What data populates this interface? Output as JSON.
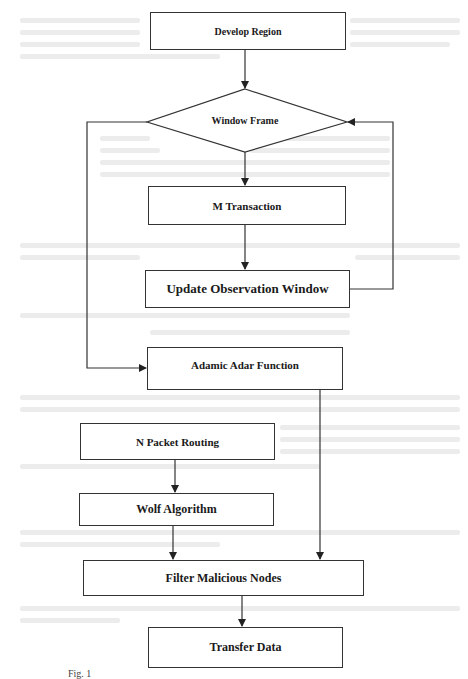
{
  "diagram": {
    "type": "flowchart",
    "nodes": [
      {
        "id": "develop_region",
        "label": "Develop Region",
        "shape": "rectangle"
      },
      {
        "id": "window_frame",
        "label": "Window Frame",
        "shape": "diamond"
      },
      {
        "id": "m_transaction",
        "label": "M Transaction",
        "shape": "rectangle"
      },
      {
        "id": "update_observation_window",
        "label": "Update Observation Window",
        "shape": "rectangle"
      },
      {
        "id": "adamic_adar_function",
        "label": "Adamic Adar Function",
        "shape": "rectangle"
      },
      {
        "id": "n_packet_routing",
        "label": "N Packet Routing",
        "shape": "rectangle"
      },
      {
        "id": "wolf_algorithm",
        "label": "Wolf Algorithm",
        "shape": "rectangle"
      },
      {
        "id": "filter_malicious_nodes",
        "label": "Filter Malicious Nodes",
        "shape": "rectangle"
      },
      {
        "id": "transfer_data",
        "label": "Transfer Data",
        "shape": "rectangle"
      }
    ],
    "edges": [
      {
        "from": "develop_region",
        "to": "window_frame"
      },
      {
        "from": "window_frame",
        "to": "m_transaction"
      },
      {
        "from": "window_frame",
        "to": "adamic_adar_function",
        "route": "left loop"
      },
      {
        "from": "m_transaction",
        "to": "update_observation_window"
      },
      {
        "from": "update_observation_window",
        "to": "window_frame",
        "route": "right loop"
      },
      {
        "from": "adamic_adar_function",
        "to": "filter_malicious_nodes"
      },
      {
        "from": "n_packet_routing",
        "to": "wolf_algorithm"
      },
      {
        "from": "wolf_algorithm",
        "to": "filter_malicious_nodes"
      },
      {
        "from": "filter_malicious_nodes",
        "to": "transfer_data"
      }
    ]
  },
  "caption": "Fig. 1"
}
